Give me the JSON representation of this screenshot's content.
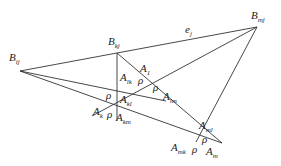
{
  "diagram": {
    "line_color": "#333333",
    "points": {
      "Bij": [
        20,
        71
      ],
      "Bkj": [
        117,
        53
      ],
      "Bmj": [
        257,
        27
      ],
      "Alm": [
        166,
        101
      ],
      "Am": [
        222,
        143
      ],
      "Ak": [
        92,
        116
      ],
      "Amk": [
        196,
        142
      ],
      "Akm": [
        117,
        121
      ]
    },
    "lines": [
      [
        "Bij",
        "Bmj"
      ],
      [
        "Bij",
        "Alm"
      ],
      [
        "Bij",
        "Am"
      ],
      [
        "Bmj",
        "Ak"
      ],
      [
        "Bmj",
        "Amk"
      ],
      [
        "Bkj",
        "Akm"
      ],
      [
        "Bkj",
        "Am"
      ]
    ],
    "labels": [
      {
        "id": "B_ij",
        "base": "B",
        "sub": "ij",
        "x": 9,
        "y": 52
      },
      {
        "id": "B_kj",
        "base": "B",
        "sub": "kj",
        "x": 108,
        "y": 36
      },
      {
        "id": "B_mj",
        "base": "B",
        "sub": "mj",
        "x": 251,
        "y": 10
      },
      {
        "id": "e_j",
        "base": "e",
        "sub": "j",
        "x": 185,
        "y": 24
      },
      {
        "id": "A_1",
        "base": "A",
        "sub": "1",
        "x": 140,
        "y": 63
      },
      {
        "id": "A_lk",
        "base": "A",
        "sub": "lk",
        "x": 120,
        "y": 72
      },
      {
        "id": "rho_1",
        "base": "ρ",
        "sub": "",
        "x": 138,
        "y": 75
      },
      {
        "id": "rho_2",
        "base": "ρ",
        "sub": "",
        "x": 153,
        "y": 82
      },
      {
        "id": "A_lm",
        "base": "A",
        "sub": "lm",
        "x": 163,
        "y": 91
      },
      {
        "id": "rho_3",
        "base": "ρ",
        "sub": "",
        "x": 106,
        "y": 90
      },
      {
        "id": "A_kl",
        "base": "A",
        "sub": "kl",
        "x": 120,
        "y": 94
      },
      {
        "id": "A_k",
        "base": "A",
        "sub": "k",
        "x": 93,
        "y": 106
      },
      {
        "id": "rho_4",
        "base": "ρ",
        "sub": "",
        "x": 107,
        "y": 109
      },
      {
        "id": "A_km",
        "base": "A",
        "sub": "km",
        "x": 116,
        "y": 112
      },
      {
        "id": "A_ml",
        "base": "A",
        "sub": "ml",
        "x": 199,
        "y": 120
      },
      {
        "id": "rho_5",
        "base": "ρ",
        "sub": "",
        "x": 202,
        "y": 134
      },
      {
        "id": "A_mk",
        "base": "A",
        "sub": "mk",
        "x": 171,
        "y": 142
      },
      {
        "id": "rho_6",
        "base": "ρ",
        "sub": "",
        "x": 192,
        "y": 144
      },
      {
        "id": "A_m",
        "base": "A",
        "sub": "m",
        "x": 206,
        "y": 146
      }
    ]
  }
}
